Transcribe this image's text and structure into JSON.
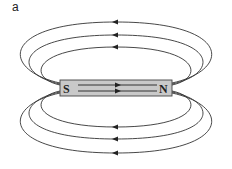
{
  "figure": {
    "panel_label": "a",
    "magnet": {
      "south_label": "S",
      "north_label": "N",
      "fill_color": "#c9c9c9",
      "stroke_color": "#444444"
    },
    "field_lines": {
      "count_above": 3,
      "count_below": 3,
      "internal_lines": 2,
      "direction_outside": "N to S (right to left)",
      "direction_inside": "S to N (left to right)",
      "line_color": "#333333"
    }
  }
}
